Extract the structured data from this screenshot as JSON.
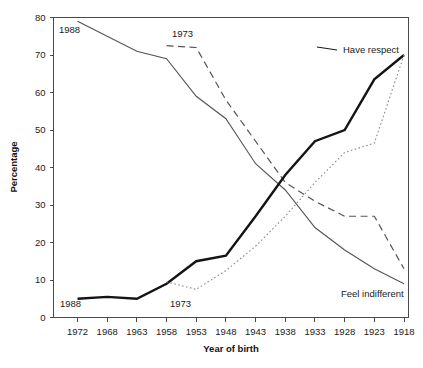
{
  "chart_data": {
    "type": "line",
    "title": "",
    "xlabel": "Year of birth",
    "ylabel": "Percentage",
    "grid": false,
    "legend_position": "inline-annotations",
    "categories": [
      1972,
      1968,
      1963,
      1958,
      1953,
      1948,
      1943,
      1938,
      1933,
      1928,
      1923,
      1918
    ],
    "xtick_labels": [
      "1972",
      "1968",
      "1963",
      "1958",
      "1953",
      "1948",
      "1943",
      "1938",
      "1933",
      "1928",
      "1923",
      "1918"
    ],
    "ytick_labels": [
      "0",
      "10",
      "20",
      "30",
      "40",
      "50",
      "60",
      "70",
      "80"
    ],
    "ylim": [
      0,
      80
    ],
    "ytick_step": 10,
    "series": [
      {
        "name": "Feel indifferent 1988",
        "style": "solid-thin",
        "color": "#545454",
        "annotation": "1988",
        "values": [
          79,
          75,
          71,
          69,
          59,
          53,
          41,
          34,
          24,
          18,
          13,
          9
        ]
      },
      {
        "name": "Feel indifferent 1973",
        "style": "dashed",
        "color": "#545454",
        "annotation": "1973",
        "values": [
          null,
          null,
          null,
          72.5,
          72,
          58,
          47,
          36,
          31,
          27,
          27,
          13
        ]
      },
      {
        "name": "Have respect 1988",
        "style": "solid-bold",
        "color": "#141414",
        "annotation": "1988",
        "values": [
          5,
          5.5,
          5,
          9,
          15,
          16.5,
          27,
          38,
          47,
          50,
          63.5,
          70
        ]
      },
      {
        "name": "Have respect 1973",
        "style": "dotted",
        "color": "#8a8a8a",
        "annotation": "1973",
        "values": [
          null,
          null,
          null,
          9.5,
          7.5,
          12.5,
          19,
          27,
          36,
          44,
          46.5,
          70
        ]
      }
    ],
    "annotations": [
      {
        "id": "anno-top-left-1988",
        "label": "1988",
        "series": "Feel indifferent 1988"
      },
      {
        "id": "anno-top-1973",
        "label": "1973",
        "series": "Feel indifferent 1973"
      },
      {
        "id": "anno-bottom-1988",
        "label": "1988",
        "series": "Have respect 1988"
      },
      {
        "id": "anno-bottom-1973",
        "label": "1973",
        "series": "Have respect 1973"
      },
      {
        "id": "anno-have-respect",
        "label": "Have respect",
        "series": "Have respect 1988"
      },
      {
        "id": "anno-feel-indifferent",
        "label": "Feel indifferent",
        "series": "Feel indifferent 1988"
      }
    ]
  }
}
